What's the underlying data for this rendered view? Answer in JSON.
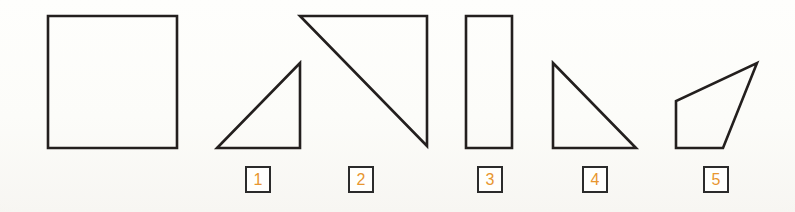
{
  "page": {
    "width": 795,
    "height": 212,
    "background_color": "#fdfdfa",
    "stroke_color": "#231f1e",
    "label_border_color": "#2b2b2b",
    "label_digit_color": "#e8962f"
  },
  "figures": [
    {
      "id": "figure-square",
      "kind": "square",
      "label": null,
      "points": "48,16 177,16 177,148 48,148",
      "stroke_width": 2.6
    },
    {
      "id": "figure-right-triangle-1",
      "kind": "right-triangle",
      "label": "1",
      "points": "300,63 300,148 217,148",
      "stroke_width": 2.6
    },
    {
      "id": "figure-right-triangle-2",
      "kind": "right-triangle",
      "label": "2",
      "points": "300,16 427,16 427,146",
      "stroke_width": 2.6
    },
    {
      "id": "figure-rectangle-3",
      "kind": "rectangle",
      "label": "3",
      "points": "466,16 512,16 512,148 466,148",
      "stroke_width": 2.6
    },
    {
      "id": "figure-right-triangle-4",
      "kind": "right-triangle",
      "label": "4",
      "points": "553,63 636,148 553,148",
      "stroke_width": 2.6
    },
    {
      "id": "figure-quadrilateral-5",
      "kind": "quadrilateral",
      "label": "5",
      "points": "757,63 723,148 676,148 676,101",
      "stroke_width": 2.6
    }
  ],
  "labels": [
    {
      "id": "label-1",
      "text": "1",
      "x": 245,
      "y": 166
    },
    {
      "id": "label-2",
      "text": "2",
      "x": 348,
      "y": 166
    },
    {
      "id": "label-3",
      "text": "3",
      "x": 477,
      "y": 166
    },
    {
      "id": "label-4",
      "text": "4",
      "x": 582,
      "y": 166
    },
    {
      "id": "label-5",
      "text": "5",
      "x": 703,
      "y": 166
    }
  ]
}
